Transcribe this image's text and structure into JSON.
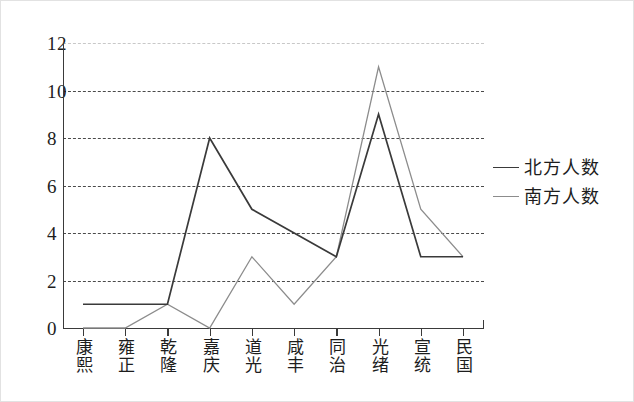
{
  "chart_data": {
    "type": "line",
    "title": "",
    "subtitle": "",
    "xlabel": "",
    "ylabel": "",
    "categories": [
      "康熙",
      "雍正",
      "乾隆",
      "嘉庆",
      "道光",
      "咸丰",
      "同治",
      "光绪",
      "宣统",
      "民国"
    ],
    "series": [
      {
        "name": "北方人数",
        "color": "#3a3a3a",
        "values": [
          1,
          1,
          1,
          8,
          5,
          4,
          3,
          9,
          3,
          3
        ]
      },
      {
        "name": "南方人数",
        "color": "#8c8c8c",
        "values": [
          0,
          0,
          1,
          0,
          3,
          1,
          3,
          11,
          5,
          3
        ]
      }
    ],
    "ylim": [
      0,
      12
    ],
    "yticks": [
      0,
      2,
      4,
      6,
      8,
      10,
      12
    ],
    "ytick_labels": [
      "0",
      "2",
      "4",
      "6",
      "8",
      "10",
      "12"
    ],
    "grid": "horizontal-dashed",
    "legend_position": "right"
  },
  "legend": {
    "entries": [
      {
        "label": "北方人数",
        "color": "#3a3a3a"
      },
      {
        "label": "南方人数",
        "color": "#8c8c8c"
      }
    ]
  }
}
